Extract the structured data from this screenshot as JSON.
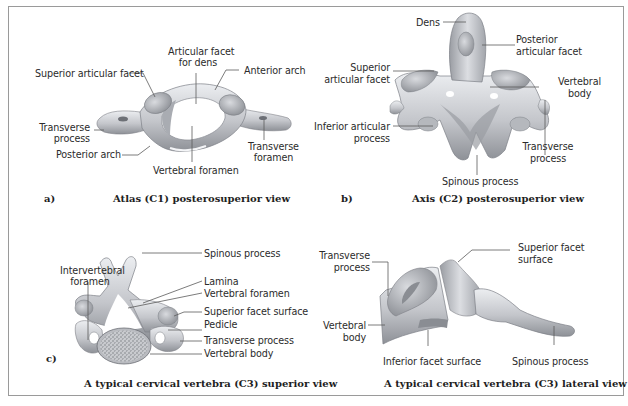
{
  "figure": {
    "panels": [
      {
        "id": "a",
        "letter": "a)",
        "caption": "Atlas (C1) posterosuperior view",
        "labels": {
          "superior_articular_facet": "Superior articular facet",
          "articular_facet_for_dens_1": "Articular facet",
          "articular_facet_for_dens_2": "for dens",
          "anterior_arch": "Anterior arch",
          "transverse_process_1": "Transverse",
          "transverse_process_2": "process",
          "posterior_arch": "Posterior arch",
          "transverse_foramen_1": "Transverse",
          "transverse_foramen_2": "foramen",
          "vertebral_foramen": "Vertebral foramen"
        }
      },
      {
        "id": "b",
        "letter": "b)",
        "caption": "Axis (C2) posterosuperior view",
        "labels": {
          "dens": "Dens",
          "posterior_articular_facet_1": "Posterior",
          "posterior_articular_facet_2": "articular facet",
          "superior_articular_facet_1": "Superior",
          "superior_articular_facet_2": "articular facet",
          "vertebral_body_1": "Vertebral",
          "vertebral_body_2": "body",
          "inferior_articular_process_1": "Inferior articular",
          "inferior_articular_process_2": "process",
          "transverse_process_1": "Transverse",
          "transverse_process_2": "process",
          "spinous_process": "Spinous process"
        }
      },
      {
        "id": "c",
        "letter": "c)",
        "caption": "A typical cervical vertebra (C3) superior view",
        "labels": {
          "spinous_process": "Spinous process",
          "intervertebral_foramen_1": "Intervertebral",
          "intervertebral_foramen_2": "foramen",
          "lamina": "Lamina",
          "vertebral_foramen": "Vertebral foramen",
          "superior_facet_surface": "Superior facet surface",
          "pedicle": "Pedicle",
          "transverse_process": "Transverse process",
          "vertebral_body": "Vertebral body"
        }
      },
      {
        "id": "d",
        "letter": "",
        "caption": "A typical cervical vertebra (C3) lateral view",
        "labels": {
          "transverse_process_1": "Transverse",
          "transverse_process_2": "process",
          "superior_facet_surface_1": "Superior facet",
          "superior_facet_surface_2": "surface",
          "vertebral_body_1": "Vertebral",
          "vertebral_body_2": "body",
          "inferior_facet_surface": "Inferior facet surface",
          "spinous_process": "Spinous process"
        }
      }
    ]
  },
  "colors": {
    "bone_light": "#e2e3e6",
    "bone_mid": "#b9bbc0",
    "bone_dark": "#7d8086",
    "frame": "#9a9a9a",
    "text": "#2b2b2b"
  }
}
